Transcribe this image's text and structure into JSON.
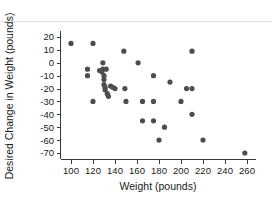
{
  "chart_data": {
    "type": "scatter",
    "title": "",
    "xlabel": "Weight (pounds)",
    "ylabel": "Desired Change in Weight (pounds)",
    "xlim": [
      92,
      266
    ],
    "ylim": [
      -75,
      24
    ],
    "xticks": [
      100,
      120,
      140,
      160,
      180,
      200,
      220,
      240,
      260
    ],
    "yticks": [
      20,
      10,
      0,
      -10,
      -20,
      -30,
      -40,
      -50,
      -60,
      -70
    ],
    "xtick_labels": [
      "100",
      "120",
      "140",
      "160",
      "180",
      "200",
      "220",
      "240",
      "260"
    ],
    "ytick_labels": [
      "20",
      "10",
      "0",
      "-10",
      "-20",
      "-30",
      "-40",
      "-50",
      "-60",
      "-70"
    ],
    "grid": false,
    "legend": null,
    "marker": {
      "shape": "circle",
      "color": "#4d4d4d",
      "size": 2.6
    },
    "series": [
      {
        "name": "Respondents",
        "points": [
          [
            100,
            15
          ],
          [
            115,
            -5
          ],
          [
            115,
            -10
          ],
          [
            120,
            15
          ],
          [
            120,
            -30
          ],
          [
            126,
            -6
          ],
          [
            128,
            -7
          ],
          [
            129,
            0
          ],
          [
            129,
            -5
          ],
          [
            130,
            -10
          ],
          [
            130,
            -13
          ],
          [
            130,
            -17
          ],
          [
            131,
            -19
          ],
          [
            131,
            -21
          ],
          [
            132,
            -5
          ],
          [
            133,
            -24
          ],
          [
            134,
            -26
          ],
          [
            136,
            -18
          ],
          [
            138,
            -19
          ],
          [
            140,
            -20
          ],
          [
            148,
            9
          ],
          [
            149,
            -20
          ],
          [
            150,
            -30
          ],
          [
            161,
            0
          ],
          [
            165,
            -30
          ],
          [
            165,
            -45
          ],
          [
            175,
            -10
          ],
          [
            175,
            -30
          ],
          [
            175,
            -45
          ],
          [
            180,
            -60
          ],
          [
            185,
            -50
          ],
          [
            190,
            -15
          ],
          [
            200,
            -30
          ],
          [
            205,
            -20
          ],
          [
            210,
            9
          ],
          [
            210,
            -20
          ],
          [
            210,
            -40
          ],
          [
            220,
            -60
          ],
          [
            258,
            -70
          ]
        ]
      }
    ]
  },
  "axes": {
    "x_axis_name": "weight-axis",
    "y_axis_name": "desired-change-axis"
  }
}
